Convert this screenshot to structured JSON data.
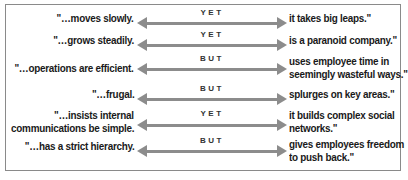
{
  "colors": {
    "arrow": "#8c8c8c",
    "text": "#1a1a1a",
    "border": "#8a8a8a"
  },
  "rows": [
    {
      "left": "\"…moves slowly.",
      "conjunction": "YET",
      "right": "it takes big leaps.\""
    },
    {
      "left": "\"…grows steadily.",
      "conjunction": "YET",
      "right": "is a paranoid company.\""
    },
    {
      "left": "\"…operations are efficient.",
      "conjunction": "BUT",
      "right_line1": "uses employee time in",
      "right_line2": "seemingly wasteful ways.\""
    },
    {
      "left": "\"…frugal.",
      "conjunction": "BUT",
      "right": "splurges on key areas.\""
    },
    {
      "left_line1": "\"…insists internal",
      "left_line2": "communications be simple.",
      "conjunction": "YET",
      "right_line1": "it builds complex social",
      "right_line2": "networks.\""
    },
    {
      "left": "\"…has a strict hierarchy.",
      "conjunction": "BUT",
      "right_line1": "gives employees freedom",
      "right_line2": "to push back.\""
    }
  ]
}
